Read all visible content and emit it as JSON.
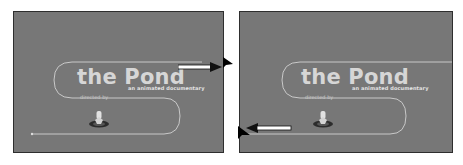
{
  "panels": [
    {
      "id": "left",
      "title": "the Pond",
      "tagline": "an animated documentary",
      "credit": "directed by",
      "arrow_direction": "right"
    },
    {
      "id": "right",
      "title": "the Pond",
      "tagline": "an animated documentary",
      "credit": "directed by",
      "arrow_direction": "left"
    }
  ],
  "colors": {
    "stage_background": "#777777",
    "title_text": "#d6d6d6",
    "motion_path": "#c9c9c9",
    "cursor": "#000000"
  }
}
